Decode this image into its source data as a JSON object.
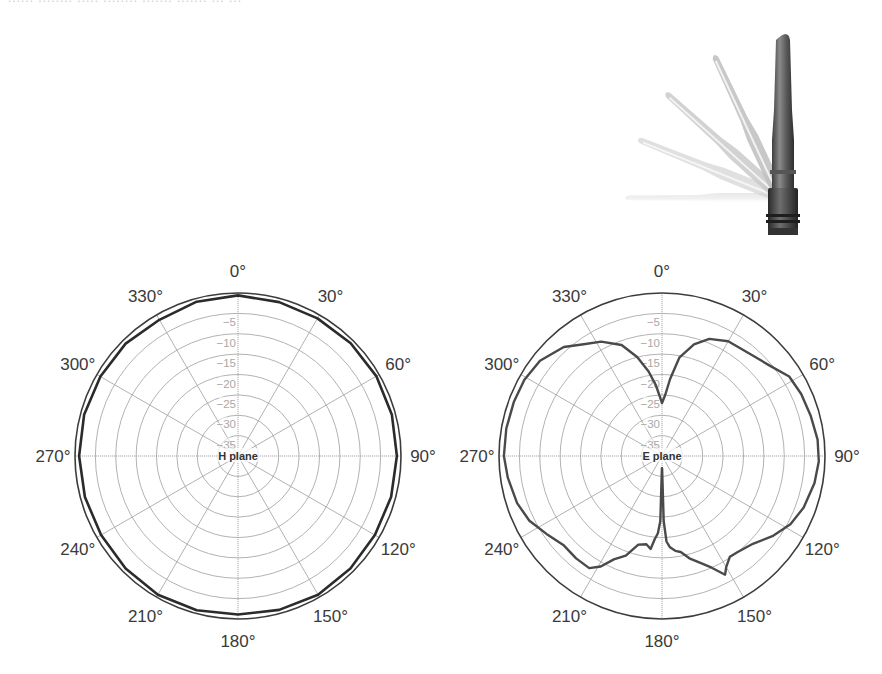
{
  "header": {
    "clipped_caption": "...... ........ ..... ........ ....... ....... ... ..."
  },
  "product_image": {
    "name": "swivel-antenna-illustration",
    "description": "Rubber-duck antenna shown tilting from vertical to horizontal"
  },
  "colors": {
    "trace": "#4a4a4a",
    "trace_h": "#2b2b2b",
    "outer_ring": "#3c3c3c",
    "grid": "#a9a9a9",
    "tick_text": "#3a3a3a",
    "ring_text": "#a8a8a8"
  },
  "chart_data": [
    {
      "type": "polar-line",
      "title": "H plane",
      "center_label": "H plane",
      "angle_ticks": [
        "0°",
        "30°",
        "60°",
        "90°",
        "120°",
        "150°",
        "180°",
        "210°",
        "240°",
        "270°",
        "300°",
        "330°"
      ],
      "radial_ticks": [
        "−5",
        "−10",
        "−15",
        "−20",
        "−25",
        "−30",
        "−35"
      ],
      "radial_range_db": [
        -40,
        0
      ],
      "grid": true,
      "series": [
        {
          "name": "H plane gain (dB)",
          "angles_deg": [
            0,
            15,
            30,
            45,
            60,
            75,
            90,
            105,
            120,
            135,
            150,
            165,
            180,
            195,
            210,
            225,
            240,
            255,
            270,
            285,
            300,
            315,
            330,
            345,
            360
          ],
          "values_db": [
            -0.6,
            -0.9,
            -1.0,
            -0.9,
            -0.8,
            -0.9,
            -1.0,
            -1.1,
            -1.2,
            -1.0,
            -0.7,
            -0.9,
            -1.1,
            -0.8,
            -0.7,
            -1.0,
            -1.2,
            -1.1,
            -1.0,
            -0.9,
            -1.0,
            -1.0,
            -1.4,
            -0.8,
            -0.6
          ]
        }
      ]
    },
    {
      "type": "polar-line",
      "title": "E plane",
      "center_label": "E plane",
      "angle_ticks": [
        "0°",
        "30°",
        "60°",
        "90°",
        "120°",
        "150°",
        "180°",
        "210°",
        "240°",
        "270°",
        "300°",
        "330°"
      ],
      "radial_ticks": [
        "−5",
        "−10",
        "−15",
        "−20",
        "−25",
        "−30",
        "−35"
      ],
      "radial_range_db": [
        -40,
        0
      ],
      "grid": true,
      "series": [
        {
          "name": "E plane gain (dB)",
          "angles_deg": [
            0,
            3,
            6,
            10,
            16,
            22,
            30,
            40,
            50,
            58,
            66,
            75,
            84,
            92,
            100,
            110,
            118,
            126,
            134,
            142,
            146,
            150,
            152,
            156,
            160,
            165,
            169,
            172,
            175,
            177,
            178.5,
            179.5,
            180.5,
            181.5,
            183,
            185,
            187,
            190,
            195,
            200,
            205,
            209,
            213,
            220,
            228,
            236,
            244,
            252,
            262,
            270,
            280,
            290,
            299,
            308,
            318,
            325,
            332,
            340,
            346,
            351,
            355,
            358,
            360
          ],
          "values_db": [
            -27,
            -25,
            -21,
            -15.5,
            -11.5,
            -9,
            -7.5,
            -7,
            -5.5,
            -3.2,
            -2.6,
            -2.2,
            -1.6,
            -1.5,
            -2.0,
            -3.0,
            -4.3,
            -6.5,
            -9.0,
            -10.0,
            -10.2,
            -8.5,
            -7.0,
            -10.0,
            -12.0,
            -14.0,
            -16.0,
            -16.5,
            -17.5,
            -19.0,
            -24,
            -37,
            -37,
            -24,
            -21,
            -19.5,
            -17.0,
            -18.0,
            -17.5,
            -14.0,
            -12.0,
            -9.0,
            -7.2,
            -7.2,
            -7.4,
            -5.8,
            -3.8,
            -2.6,
            -1.8,
            -1.2,
            -1.2,
            -1.3,
            -1.4,
            -2.0,
            -4.0,
            -6.5,
            -8.2,
            -11.0,
            -15.0,
            -19.0,
            -22.5,
            -25.5,
            -27
          ]
        }
      ]
    }
  ]
}
